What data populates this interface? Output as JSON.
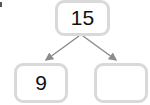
{
  "diagram": {
    "type": "number-bond",
    "whole": {
      "value": "15"
    },
    "parts": [
      {
        "value": "9"
      },
      {
        "value": ""
      }
    ],
    "colors": {
      "box_border": "#d9d9d9",
      "arrow": "#8c8c8c",
      "text": "#111111"
    }
  }
}
